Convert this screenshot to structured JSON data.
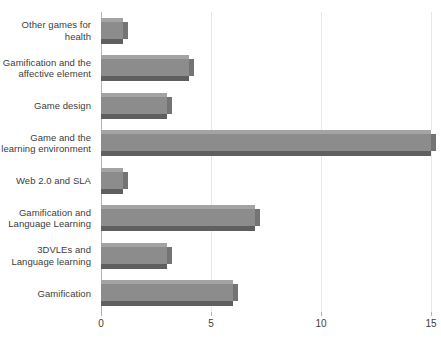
{
  "chart_data": {
    "type": "bar",
    "orientation": "horizontal",
    "title": "",
    "subtitle": "",
    "xlabel": "",
    "ylabel": "",
    "xlim": [
      0,
      15
    ],
    "grid": true,
    "legend": false,
    "legend_position": "none",
    "xticks": [
      0,
      5,
      10,
      15
    ],
    "xtick_labels": [
      "0",
      "5",
      "10",
      "15"
    ],
    "categories": [
      "Other games for health",
      "Gamification and the affective element",
      "Game design",
      "Game and the learning environment",
      "Web 2.0 and SLA",
      "Gamification and Language Learning",
      "3DVLEs and Language learning",
      "Gamification"
    ],
    "values": [
      1,
      4,
      3,
      15,
      1,
      7,
      3,
      6
    ],
    "series": [
      {
        "name": "Count",
        "values": [
          1,
          4,
          3,
          15,
          1,
          7,
          3,
          6
        ]
      }
    ],
    "colors": {
      "bar_face": "#8c8c8c",
      "bar_top": "#a3a3a3",
      "bar_bottom": "#5f5f5f",
      "bar_side": "#747474",
      "gridline": "#e8e8e8",
      "axis_line": "#b4b4b4",
      "text": "#3d3d3d",
      "background": "#ffffff"
    }
  }
}
